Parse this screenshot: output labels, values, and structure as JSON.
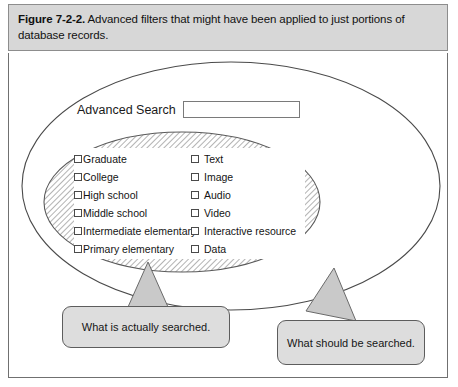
{
  "caption": {
    "label": "Figure 7-2-2.",
    "text": " Advanced filters that might have been applied to just portions of database records."
  },
  "search": {
    "label": "Advanced Search",
    "value": "",
    "placeholder": ""
  },
  "filters": {
    "education_column": [
      {
        "label": "Graduate",
        "checked": false
      },
      {
        "label": "College",
        "checked": false
      },
      {
        "label": "High school",
        "checked": false
      },
      {
        "label": "Middle school",
        "checked": false
      },
      {
        "label": "Intermediate elementary",
        "checked": false
      },
      {
        "label": "Primary elementary",
        "checked": false
      }
    ],
    "format_column": [
      {
        "label": "Text",
        "checked": false
      },
      {
        "label": "Image",
        "checked": false
      },
      {
        "label": "Audio",
        "checked": false
      },
      {
        "label": "Video",
        "checked": false
      },
      {
        "label": "Interactive resource",
        "checked": false
      },
      {
        "label": "Data",
        "checked": false
      }
    ]
  },
  "callouts": {
    "actual": "What is actually searched.",
    "should": "What should be searched."
  },
  "colors": {
    "caption_band": "#d7d7d7",
    "callout_fill": "#dddddd",
    "hatch_stroke": "#9a9a9a",
    "outline": "#4a4a4a",
    "pointer_fill": "#c9c9c9"
  }
}
